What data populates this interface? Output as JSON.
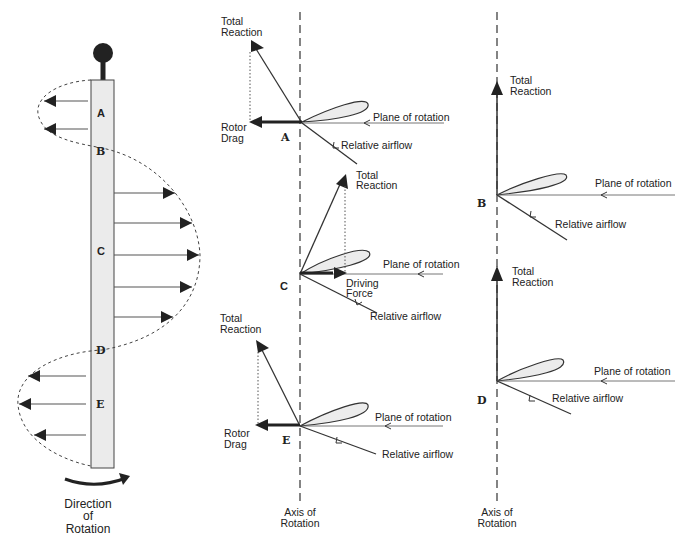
{
  "colors": {
    "line": "#2a2a2a",
    "blade_fill": "#ebebeb",
    "airfoil_fill": "#ececec",
    "background": "#ffffff"
  },
  "blade": {
    "stations": [
      "A",
      "B",
      "C",
      "D",
      "E"
    ],
    "direction_label_1": "Direction",
    "direction_label_2": "of",
    "direction_label_3": "Rotation"
  },
  "diagrams": {
    "A": {
      "station": "A",
      "total_reaction_1": "Total",
      "total_reaction_2": "Reaction",
      "force_1": "Rotor",
      "force_2": "Drag",
      "plane": "Plane of rotation",
      "airflow": "Relative airflow"
    },
    "B": {
      "station": "B",
      "total_reaction_1": "Total",
      "total_reaction_2": "Reaction",
      "plane": "Plane of rotation",
      "airflow": "Relative airflow"
    },
    "C": {
      "station": "C",
      "total_reaction_1": "Total",
      "total_reaction_2": "Reaction",
      "force_1": "Driving",
      "force_2": "Force",
      "plane": "Plane of rotation",
      "airflow": "Relative airflow"
    },
    "D": {
      "station": "D",
      "total_reaction_1": "Total",
      "total_reaction_2": "Reaction",
      "plane": "Plane of rotation",
      "airflow": "Relative airflow"
    },
    "E": {
      "station": "E",
      "total_reaction_1": "Total",
      "total_reaction_2": "Reaction",
      "force_1": "Rotor",
      "force_2": "Drag",
      "plane": "Plane of rotation",
      "airflow": "Relative airflow"
    }
  },
  "axes": {
    "axis_label_1": "Axis of",
    "axis_label_2": "Rotation"
  }
}
